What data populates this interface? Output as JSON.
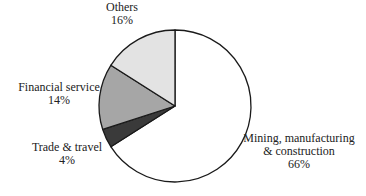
{
  "chart_data": {
    "type": "pie",
    "title": "",
    "start_angle_deg": 0,
    "direction": "clockwise",
    "slices": [
      {
        "label": "Mining, manufacturing & construction",
        "label_lines": [
          "Mining, manufacturing",
          "& construction"
        ],
        "value": 66,
        "value_label": "66%",
        "color": "#ffffff"
      },
      {
        "label": "Trade & travel",
        "label_lines": [
          "Trade & travel"
        ],
        "value": 4,
        "value_label": "4%",
        "color": "#3a3a3a"
      },
      {
        "label": "Financial service",
        "label_lines": [
          "Financial service"
        ],
        "value": 14,
        "value_label": "14%",
        "color": "#a6a6a6"
      },
      {
        "label": "Others",
        "label_lines": [
          "Others"
        ],
        "value": 16,
        "value_label": "16%",
        "color": "#e3e3e3"
      }
    ],
    "legend": "none",
    "labels_outside": true
  }
}
